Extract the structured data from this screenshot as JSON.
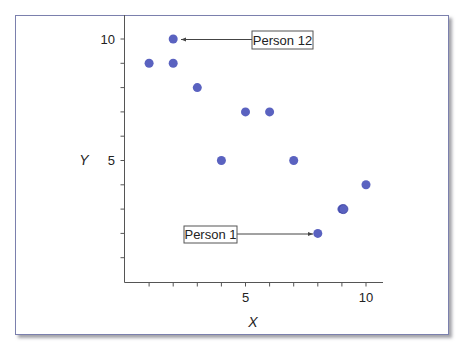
{
  "chart_data": {
    "type": "scatter",
    "title": "",
    "xlabel": "X",
    "ylabel": "Y",
    "xlim": [
      0,
      10.7
    ],
    "ylim": [
      0,
      10.7
    ],
    "x_ticks": [
      1,
      2,
      3,
      4,
      5,
      6,
      7,
      8,
      9,
      10
    ],
    "x_tick_labels": {
      "5": "5",
      "10": "10"
    },
    "y_ticks": [
      1,
      2,
      3,
      4,
      5,
      6,
      7,
      8,
      9,
      10
    ],
    "y_tick_labels": {
      "5": "5",
      "10": "10"
    },
    "grid": false,
    "legend": null,
    "marker_color": "#5a62c0",
    "points": [
      {
        "x": 8,
        "y": 2,
        "label": "Person 1"
      },
      {
        "x": 1,
        "y": 9
      },
      {
        "x": 2,
        "y": 9
      },
      {
        "x": 3,
        "y": 8
      },
      {
        "x": 4,
        "y": 5
      },
      {
        "x": 5,
        "y": 7
      },
      {
        "x": 6,
        "y": 7
      },
      {
        "x": 7,
        "y": 5
      },
      {
        "x": 9,
        "y": 3
      },
      {
        "x": 9,
        "y": 3
      },
      {
        "x": 10,
        "y": 4
      },
      {
        "x": 2,
        "y": 10,
        "label": "Person 12"
      }
    ],
    "annotations": [
      {
        "text": "Person 12",
        "target": {
          "x": 2,
          "y": 10
        },
        "box_position": "right"
      },
      {
        "text": "Person 1",
        "target": {
          "x": 8,
          "y": 2
        },
        "box_position": "left"
      }
    ]
  },
  "labels": {
    "x_axis": "X",
    "y_axis": "Y",
    "x_tick_5": "5",
    "x_tick_10": "10",
    "y_tick_5": "5",
    "y_tick_10": "10",
    "callout_person12": "Person 12",
    "callout_person1": "Person 1"
  }
}
